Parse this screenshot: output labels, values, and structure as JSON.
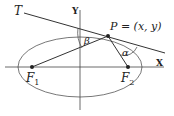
{
  "diagram": {
    "tangent_label": "T",
    "y_axis_label": "Y",
    "x_axis_label": "X",
    "point_label": "P = (x, y)",
    "focus1_label": "F",
    "focus1_sub": "1",
    "focus2_label": "F",
    "focus2_sub": "2",
    "angle_beta_label": "β",
    "angle_alpha_label": "α"
  }
}
